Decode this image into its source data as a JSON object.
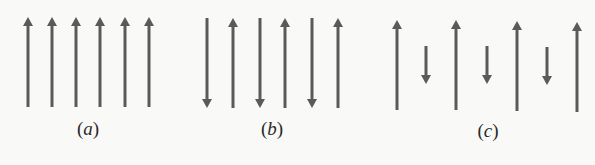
{
  "figure": {
    "arrow_color": "#5a5a5a",
    "panels": [
      {
        "id": "a",
        "label": "(a)",
        "label_letter": "a",
        "label_x": 88,
        "description": "Six parallel arrows, all pointing up, equal length (ferromagnetic)",
        "arrows": [
          {
            "x": 28,
            "y_top": 17,
            "y_bottom": 107,
            "dir": "up"
          },
          {
            "x": 52,
            "y_top": 17,
            "y_bottom": 107,
            "dir": "up"
          },
          {
            "x": 76,
            "y_top": 17,
            "y_bottom": 107,
            "dir": "up"
          },
          {
            "x": 100,
            "y_top": 17,
            "y_bottom": 107,
            "dir": "up"
          },
          {
            "x": 125,
            "y_top": 17,
            "y_bottom": 107,
            "dir": "up"
          },
          {
            "x": 149,
            "y_top": 17,
            "y_bottom": 107,
            "dir": "up"
          }
        ]
      },
      {
        "id": "b",
        "label": "(b)",
        "label_letter": "b",
        "label_x": 272,
        "description": "Six arrows alternating down/up, equal length (antiferromagnetic)",
        "arrows": [
          {
            "x": 207,
            "y_top": 18,
            "y_bottom": 108,
            "dir": "down"
          },
          {
            "x": 233,
            "y_top": 18,
            "y_bottom": 108,
            "dir": "up"
          },
          {
            "x": 260,
            "y_top": 18,
            "y_bottom": 108,
            "dir": "down"
          },
          {
            "x": 285,
            "y_top": 18,
            "y_bottom": 108,
            "dir": "up"
          },
          {
            "x": 312,
            "y_top": 18,
            "y_bottom": 108,
            "dir": "down"
          },
          {
            "x": 338,
            "y_top": 18,
            "y_bottom": 108,
            "dir": "up"
          }
        ]
      },
      {
        "id": "c",
        "label": "(c)",
        "label_letter": "c",
        "label_x": 488,
        "description": "Long up arrows alternating with short down arrows (ferrimagnetic)",
        "arrows": [
          {
            "x": 397,
            "y_top": 20,
            "y_bottom": 110,
            "dir": "up"
          },
          {
            "x": 426,
            "y_top": 46,
            "y_bottom": 84,
            "dir": "down"
          },
          {
            "x": 456,
            "y_top": 20,
            "y_bottom": 110,
            "dir": "up"
          },
          {
            "x": 487,
            "y_top": 46,
            "y_bottom": 84,
            "dir": "down"
          },
          {
            "x": 517,
            "y_top": 21,
            "y_bottom": 111,
            "dir": "up"
          },
          {
            "x": 547,
            "y_top": 47,
            "y_bottom": 85,
            "dir": "down"
          },
          {
            "x": 577,
            "y_top": 22,
            "y_bottom": 112,
            "dir": "up"
          }
        ]
      }
    ]
  }
}
